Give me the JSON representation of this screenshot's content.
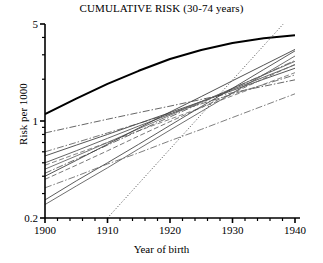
{
  "chart_data": {
    "type": "line",
    "title": "CUMULATIVE RISK (30-74 years)",
    "xlabel": "Year of birth",
    "ylabel": "Risk per 1000",
    "xlim": [
      1900,
      1940
    ],
    "ylim": [
      0.2,
      5
    ],
    "yscale": "log",
    "grid": false,
    "legend": null,
    "xticks": [
      1900,
      1910,
      1920,
      1930,
      1940
    ],
    "xtick_labels": [
      "1900",
      "1910",
      "1920",
      "1930",
      "1940"
    ],
    "xminor_step": 2,
    "yticks": [
      0.2,
      1,
      5
    ],
    "ytick_labels": [
      "0.2",
      "1",
      "5"
    ],
    "yminor": [
      0.3,
      0.4,
      0.5,
      0.6,
      0.7,
      0.8,
      0.9,
      2,
      3,
      4
    ],
    "x": [
      1900,
      1905,
      1910,
      1915,
      1920,
      1925,
      1930,
      1935,
      1940
    ],
    "series": [
      {
        "name": "overall-cumulative-risk",
        "style": "solid",
        "width": 2.0,
        "color": "#000000",
        "values": [
          1.12,
          1.45,
          1.85,
          2.3,
          2.8,
          3.25,
          3.65,
          3.95,
          4.15
        ]
      },
      {
        "name": "cohort-line-1",
        "style": "dashdot",
        "width": 0.9,
        "color": "#555555",
        "values": [
          0.82,
          0.92,
          1.03,
          1.15,
          1.28,
          1.43,
          1.6,
          1.78,
          1.98
        ]
      },
      {
        "name": "cohort-line-2",
        "style": "dashdot",
        "width": 0.9,
        "color": "#666666",
        "values": [
          0.6,
          0.7,
          0.82,
          0.96,
          1.13,
          1.33,
          1.56,
          1.83,
          2.15
        ]
      },
      {
        "name": "cohort-line-3",
        "style": "solid",
        "width": 0.9,
        "color": "#444444",
        "values": [
          0.56,
          0.67,
          0.8,
          0.96,
          1.15,
          1.38,
          1.66,
          2.0,
          2.4
        ]
      },
      {
        "name": "cohort-line-4",
        "style": "solid",
        "width": 0.9,
        "color": "#555555",
        "values": [
          0.5,
          0.61,
          0.75,
          0.92,
          1.12,
          1.38,
          1.69,
          2.07,
          2.54
        ]
      },
      {
        "name": "cohort-line-5",
        "style": "dashed",
        "width": 0.9,
        "color": "#777777",
        "values": [
          0.48,
          0.58,
          0.7,
          0.85,
          1.03,
          1.25,
          1.52,
          1.84,
          2.23
        ]
      },
      {
        "name": "cohort-line-6",
        "style": "solid",
        "width": 0.9,
        "color": "#666666",
        "values": [
          0.45,
          0.56,
          0.7,
          0.88,
          1.1,
          1.37,
          1.72,
          2.15,
          2.69
        ]
      },
      {
        "name": "cohort-line-7",
        "style": "dashdot",
        "width": 0.9,
        "color": "#5a5a5a",
        "values": [
          0.42,
          0.53,
          0.67,
          0.85,
          1.07,
          1.35,
          1.71,
          2.16,
          2.73
        ]
      },
      {
        "name": "cohort-line-8",
        "style": "solid",
        "width": 0.9,
        "color": "#3f3f3f",
        "values": [
          0.4,
          0.52,
          0.68,
          0.89,
          1.16,
          1.5,
          1.95,
          2.53,
          3.28
        ]
      },
      {
        "name": "cohort-line-9",
        "style": "dashed",
        "width": 0.9,
        "color": "#6a6a6a",
        "values": [
          0.38,
          0.48,
          0.61,
          0.78,
          0.99,
          1.25,
          1.59,
          2.02,
          2.56
        ]
      },
      {
        "name": "cohort-line-10",
        "style": "dashdot",
        "width": 0.9,
        "color": "#707070",
        "values": [
          0.33,
          0.4,
          0.49,
          0.59,
          0.72,
          0.87,
          1.06,
          1.29,
          1.57
        ]
      },
      {
        "name": "cohort-line-11",
        "style": "solid",
        "width": 0.9,
        "color": "#4a4a4a",
        "values": [
          0.27,
          0.37,
          0.5,
          0.68,
          0.93,
          1.27,
          1.72,
          2.35,
          3.2
        ]
      },
      {
        "name": "cohort-line-12",
        "style": "solid",
        "width": 0.9,
        "color": "#5f5f5f",
        "values": [
          0.25,
          0.34,
          0.46,
          0.63,
          0.86,
          1.17,
          1.59,
          2.16,
          2.94
        ]
      },
      {
        "name": "cohort-line-13-steep-dotted",
        "style": "dotted",
        "width": 0.9,
        "color": "#333333",
        "x": [
          1910,
          1940
        ],
        "values": [
          0.2,
          6.2
        ]
      }
    ],
    "annotations": []
  }
}
